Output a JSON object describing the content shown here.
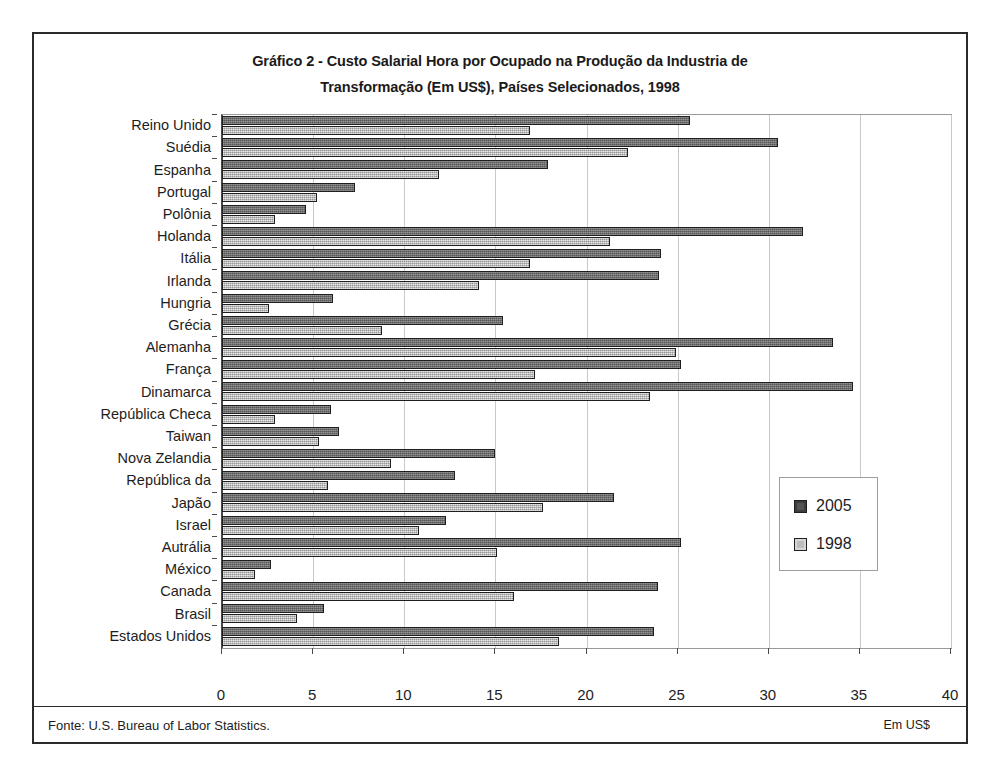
{
  "chart_data": {
    "type": "bar",
    "orientation": "horizontal",
    "title": "Gráfico 2 -   Custo Salarial Hora por Ocupado na Produção da Industria de Transformação (Em US$), Países Selecionados, 1998",
    "title_line1": "Gráfico 2 -   Custo Salarial Hora por Ocupado na Produção da Industria de",
    "title_line2": "Transformação (Em US$), Países Selecionados, 1998",
    "xlabel": "Em US$",
    "ylabel": "",
    "xlim": [
      0,
      40
    ],
    "xticks": [
      0,
      5,
      10,
      15,
      20,
      25,
      30,
      35,
      40
    ],
    "grid": "vertical",
    "legend_position": "center-right",
    "categories": [
      "Reino Unido",
      "Suédia",
      "Espanha",
      "Portugal",
      "Polônia",
      "Holanda",
      "Itália",
      "Irlanda",
      "Hungria",
      "Grécia",
      "Alemanha",
      "França",
      "Dinamarca",
      "República Checa",
      "Taiwan",
      "Nova Zelandia",
      "República da",
      "Japão",
      "Israel",
      "Autrália",
      "México",
      "Canada",
      "Brasil",
      "Estados Unidos"
    ],
    "series": [
      {
        "name": "2005",
        "color": "#6e6e6e",
        "values": [
          25.7,
          30.5,
          17.9,
          7.3,
          4.6,
          31.9,
          24.1,
          24.0,
          6.1,
          15.4,
          33.5,
          25.2,
          34.6,
          6.0,
          6.4,
          15.0,
          12.8,
          21.5,
          12.3,
          25.2,
          2.7,
          23.9,
          5.6,
          23.7
        ]
      },
      {
        "name": "1998",
        "color": "#bdbdbd",
        "values": [
          16.9,
          22.3,
          11.9,
          5.2,
          2.9,
          21.3,
          16.9,
          14.1,
          2.6,
          8.8,
          24.9,
          17.2,
          23.5,
          2.9,
          5.3,
          9.3,
          5.8,
          17.6,
          10.8,
          15.1,
          1.8,
          16.0,
          4.1,
          18.5
        ]
      }
    ]
  },
  "legend": {
    "items": [
      {
        "label": "2005",
        "swatch": "dark-gray-swatch"
      },
      {
        "label": "1998",
        "swatch": "light-gray-swatch"
      }
    ]
  },
  "footer": {
    "source": "Fonte: U.S. Bureau of Labor Statistics."
  }
}
